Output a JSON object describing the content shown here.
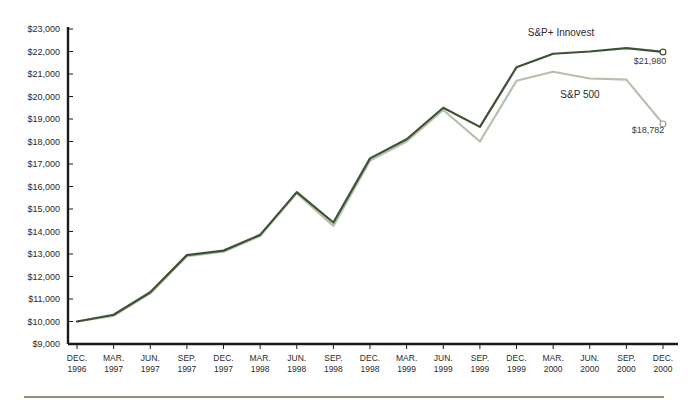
{
  "chart_data": {
    "type": "line",
    "title": "",
    "subtitle": "",
    "xlabel": "",
    "ylabel": "",
    "ylim": [
      9000,
      23000
    ],
    "ytick_step": 1000,
    "grid": false,
    "legend_position": "inline-annotation",
    "y_ticks": [
      "$23,000",
      "$22,000",
      "$21,000",
      "$20,000",
      "$19,000",
      "$18,000",
      "$17,000",
      "$16,000",
      "$15,000",
      "$14,000",
      "$13,000",
      "$12,000",
      "$11,000",
      "$10,000",
      "$9,000"
    ],
    "y_tick_values": [
      23000,
      22000,
      21000,
      20000,
      19000,
      18000,
      17000,
      16000,
      15000,
      14000,
      13000,
      12000,
      11000,
      10000,
      9000
    ],
    "categories": [
      "DEC. 1996",
      "MAR. 1997",
      "JUN. 1997",
      "SEP. 1997",
      "DEC. 1997",
      "MAR. 1998",
      "JUN. 1998",
      "SEP. 1998",
      "DEC. 1998",
      "MAR. 1999",
      "JUN. 1999",
      "SEP. 1999",
      "DEC. 1999",
      "MAR. 2000",
      "JUN. 2000",
      "SEP. 2000",
      "DEC. 2000"
    ],
    "x_tick_lines": [
      {
        "month": "DEC.",
        "year": "1996"
      },
      {
        "month": "MAR.",
        "year": "1997"
      },
      {
        "month": "JUN.",
        "year": "1997"
      },
      {
        "month": "SEP.",
        "year": "1997"
      },
      {
        "month": "DEC.",
        "year": "1997"
      },
      {
        "month": "MAR.",
        "year": "1998"
      },
      {
        "month": "JUN.",
        "year": "1998"
      },
      {
        "month": "SEP.",
        "year": "1998"
      },
      {
        "month": "DEC.",
        "year": "1998"
      },
      {
        "month": "MAR.",
        "year": "1999"
      },
      {
        "month": "JUN.",
        "year": "1999"
      },
      {
        "month": "SEP.",
        "year": "1999"
      },
      {
        "month": "DEC.",
        "year": "1999"
      },
      {
        "month": "MAR.",
        "year": "2000"
      },
      {
        "month": "JUN.",
        "year": "2000"
      },
      {
        "month": "SEP.",
        "year": "2000"
      },
      {
        "month": "DEC.",
        "year": "2000"
      }
    ],
    "series": [
      {
        "name": "S&P+ Innovest",
        "color": "#3d5233",
        "label": "S&P+ Innovest",
        "end_label": "$21,980",
        "end_value": 21980,
        "values": [
          10000,
          10300,
          11300,
          12950,
          13150,
          13850,
          15750,
          14400,
          17250,
          18100,
          19500,
          18650,
          21300,
          21900,
          22000,
          22150,
          21980
        ]
      },
      {
        "name": "S&P 500",
        "color": "#b6bfae",
        "label": "S&P 500",
        "end_label": "$18,782",
        "end_value": 18782,
        "values": [
          10000,
          10250,
          11250,
          12900,
          13100,
          13800,
          15700,
          14250,
          17150,
          18000,
          19400,
          18000,
          20700,
          21100,
          20800,
          20750,
          18782
        ]
      }
    ]
  },
  "annotations": {
    "innovest_label": "S&P+ Innovest",
    "sp500_label": "S&P 500",
    "innovest_end": "$21,980",
    "sp500_end": "$18,782"
  },
  "colors": {
    "innovest": "#3d5233",
    "sp500": "#b6bfae",
    "axis": "#1a1a1a",
    "text": "#2b2b2b",
    "base_rule": "#8a9470",
    "background": "#ffffff"
  }
}
